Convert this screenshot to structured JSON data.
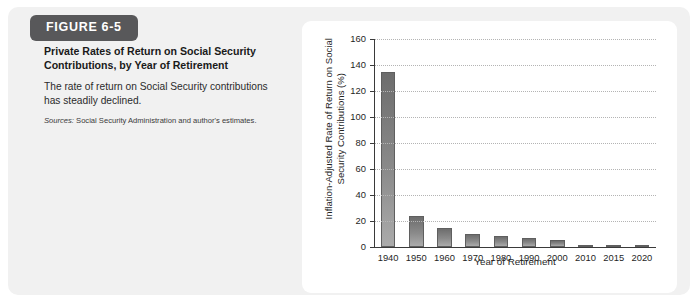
{
  "figure": {
    "badge_label": "FIGURE 6-5",
    "title": "Private Rates of Return on Social Security Contributions, by Year of Retirement",
    "description": "The rate of return on Social Security contributions has steadily declined.",
    "sources_lead": "Sources:",
    "sources_text": " Social Security Administration and author's estimates."
  },
  "colors": {
    "badge_background": "#58585a",
    "card_background": "#f1f1f1",
    "panel_background": "#ffffff",
    "bar_top": "#6d6d6d",
    "bar_bottom": "#ababab",
    "gridline": "#b4b4b4",
    "axis": "#3a3a3a"
  },
  "chart_data": {
    "type": "bar",
    "title": "",
    "xlabel": "Year of Retirement",
    "ylabel": "Inflation-Adjusted Rate of Return on Social Security Contributions (%)",
    "categories": [
      "1940",
      "1950",
      "1960",
      "1970",
      "1980",
      "1990",
      "2000",
      "2010",
      "2015",
      "2020"
    ],
    "values": [
      135,
      24,
      15,
      10,
      8.5,
      7,
      5.5,
      1.5,
      0.8,
      0.5
    ],
    "ylim": [
      0,
      160
    ],
    "yticks": [
      0,
      20,
      40,
      60,
      80,
      100,
      120,
      140,
      160
    ],
    "ytick_labels": [
      "0",
      "20",
      "40",
      "60",
      "80",
      "100",
      "120",
      "140",
      "160"
    ],
    "grid": true,
    "grid_axis": "y",
    "legend": false
  }
}
